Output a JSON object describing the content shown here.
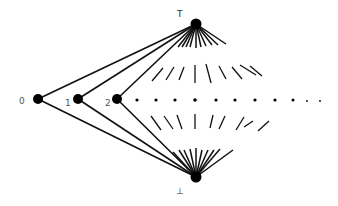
{
  "diagram": {
    "type": "lattice",
    "colors": {
      "line": "#111111",
      "node": "#000000",
      "label": "#555555",
      "background": "#ffffff"
    },
    "top": {
      "label": "T",
      "x": 196,
      "y": 24,
      "label_x": 177,
      "label_y": 17
    },
    "bottom": {
      "label": "⊥",
      "x": 196,
      "y": 177,
      "label_x": 176,
      "label_y": 194
    },
    "nodes": [
      {
        "id": "0",
        "label": "0",
        "x": 38,
        "y": 99,
        "label_x": 19,
        "label_y": 104
      },
      {
        "id": "1",
        "label": "1",
        "x": 78,
        "y": 99,
        "label_x": 65,
        "label_y": 106
      },
      {
        "id": "2",
        "label": "2",
        "x": 117,
        "y": 99,
        "label_x": 105,
        "label_y": 106
      }
    ],
    "ellipsis_dots": [
      {
        "x": 137,
        "y": 100,
        "r": 1.6
      },
      {
        "x": 156,
        "y": 100,
        "r": 1.6
      },
      {
        "x": 175,
        "y": 100,
        "r": 1.6
      },
      {
        "x": 195,
        "y": 100,
        "r": 1.8
      },
      {
        "x": 216,
        "y": 100,
        "r": 1.6
      },
      {
        "x": 235,
        "y": 100,
        "r": 1.6
      },
      {
        "x": 255,
        "y": 100,
        "r": 1.6
      },
      {
        "x": 275,
        "y": 100,
        "r": 1.6
      },
      {
        "x": 293,
        "y": 100,
        "r": 1.5
      },
      {
        "x": 307,
        "y": 101,
        "r": 0.9
      },
      {
        "x": 320,
        "y": 101,
        "r": 0.9
      }
    ],
    "top_fan_ends": [
      [
        178,
        47
      ],
      [
        182,
        47
      ],
      [
        186,
        47
      ],
      [
        190,
        47
      ],
      [
        196,
        48
      ],
      [
        201,
        47
      ],
      [
        206,
        46
      ],
      [
        212,
        45
      ],
      [
        218,
        45
      ],
      [
        226,
        44
      ]
    ],
    "bottom_fan_ends": [
      [
        173,
        152
      ],
      [
        179,
        150
      ],
      [
        184,
        150
      ],
      [
        190,
        149
      ],
      [
        196,
        148
      ],
      [
        202,
        150
      ],
      [
        208,
        150
      ],
      [
        214,
        150
      ],
      [
        220,
        149
      ],
      [
        233,
        150
      ]
    ],
    "upper_dashes": [
      [
        [
          152,
          81
        ],
        [
          163,
          68
        ]
      ],
      [
        [
          166,
          80
        ],
        [
          174,
          67
        ]
      ],
      [
        [
          179,
          80
        ],
        [
          184,
          67
        ]
      ],
      [
        [
          195,
          83
        ],
        [
          195,
          65
        ]
      ],
      [
        [
          211,
          83
        ],
        [
          206,
          64
        ]
      ],
      [
        [
          226,
          79
        ],
        [
          219,
          66
        ]
      ],
      [
        [
          242,
          79
        ],
        [
          232,
          67
        ]
      ],
      [
        [
          256,
          75
        ],
        [
          240,
          65
        ]
      ],
      [
        [
          262,
          76
        ],
        [
          250,
          66
        ]
      ]
    ],
    "lower_dashes": [
      [
        [
          151,
          116
        ],
        [
          161,
          130
        ]
      ],
      [
        [
          164,
          116
        ],
        [
          173,
          129
        ]
      ],
      [
        [
          177,
          115
        ],
        [
          182,
          129
        ]
      ],
      [
        [
          195,
          114
        ],
        [
          195,
          129
        ]
      ],
      [
        [
          213,
          115
        ],
        [
          210,
          128
        ]
      ],
      [
        [
          225,
          116
        ],
        [
          219,
          129
        ]
      ],
      [
        [
          244,
          117
        ],
        [
          236,
          130
        ]
      ],
      [
        [
          253,
          121
        ],
        [
          244,
          127
        ]
      ],
      [
        [
          269,
          121
        ],
        [
          258,
          131
        ]
      ]
    ]
  }
}
